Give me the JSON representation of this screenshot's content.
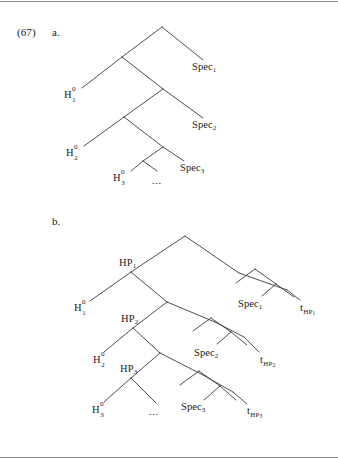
{
  "figure": {
    "example_number": "(67)",
    "items": [
      {
        "marker": "a."
      },
      {
        "marker": "b."
      }
    ]
  },
  "tree_a": {
    "caption_marker": "a.",
    "nodes": [
      {
        "id": "h1",
        "label": "H",
        "sup": "0",
        "sub": "1"
      },
      {
        "id": "h2",
        "label": "H",
        "sup": "0",
        "sub": "2"
      },
      {
        "id": "h3",
        "label": "H",
        "sup": "0",
        "sub": "3"
      },
      {
        "id": "spec1",
        "label": "Spec",
        "sub": "1"
      },
      {
        "id": "spec2",
        "label": "Spec",
        "sub": "2"
      },
      {
        "id": "spec3",
        "label": "Spec",
        "sub": "3"
      },
      {
        "id": "dots",
        "label": "..."
      }
    ],
    "labels": {
      "h1_base": "H",
      "h1_sup": "0",
      "h1_sub": "1",
      "h2_base": "H",
      "h2_sup": "0",
      "h2_sub": "2",
      "h3_base": "H",
      "h3_sup": "0",
      "h3_sub": "3",
      "spec1_base": "Spec",
      "spec1_sub": "1",
      "spec2_base": "Spec",
      "spec2_sub": "2",
      "spec3_base": "Spec",
      "spec3_sub": "3",
      "ellipsis": "..."
    }
  },
  "tree_b": {
    "caption_marker": "b.",
    "labels": {
      "hp1_base": "HP",
      "hp1_sub": "1",
      "hp2_base": "HP",
      "hp2_sub": "2",
      "hp3_base": "HP",
      "hp3_sub": "3",
      "h1_base": "H",
      "h1_sup": "0",
      "h1_sub": "1",
      "h2_base": "H",
      "h2_sup": "0",
      "h2_sub": "2",
      "h3_base": "H",
      "h3_sup": "0",
      "h3_sub": "3",
      "spec1_base": "Spec",
      "spec1_sub": "1",
      "spec2_base": "Spec",
      "spec2_sub": "2",
      "spec3_base": "Spec",
      "spec3_sub": "3",
      "trace1_base": "t",
      "trace1_sub": "HP",
      "trace1_sub2": "1",
      "trace2_base": "t",
      "trace2_sub": "HP",
      "trace2_sub2": "2",
      "trace3_base": "t",
      "trace3_sub": "HP",
      "trace3_sub2": "3",
      "ellipsis": "..."
    }
  },
  "colors": {
    "ink": "#1a1a1a",
    "line": "#3a3a3a",
    "rule": "#8d8d8d",
    "background": "#ffffff"
  }
}
